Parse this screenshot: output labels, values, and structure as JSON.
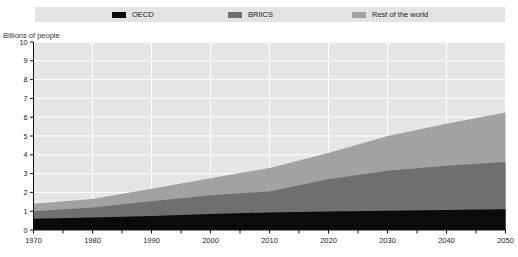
{
  "chart_data": {
    "type": "area",
    "stacked": true,
    "title": "",
    "ylabel": "Billions of people",
    "xlabel": "",
    "x": [
      1970,
      1980,
      1990,
      2000,
      2010,
      2020,
      2030,
      2040,
      2050
    ],
    "minor_tick_years": [
      1970,
      1975,
      1980,
      1985,
      1990,
      1995,
      2000,
      2005,
      2010,
      2015,
      2020,
      2025,
      2030,
      2035,
      2040,
      2045,
      2050
    ],
    "ylim": [
      0,
      10
    ],
    "yticks": [
      0,
      1,
      2,
      3,
      4,
      5,
      6,
      7,
      8,
      9,
      10
    ],
    "grid": true,
    "legend_position": "top",
    "series": [
      {
        "name": "OECD",
        "color": "#0b0b0b",
        "values": [
          0.6,
          0.66,
          0.74,
          0.85,
          0.93,
          0.99,
          1.03,
          1.07,
          1.1
        ]
      },
      {
        "name": "BRIICS",
        "color": "#6f6f6f",
        "values": [
          0.4,
          0.54,
          0.79,
          1.0,
          1.12,
          1.71,
          2.12,
          2.35,
          2.52
        ]
      },
      {
        "name": "Rest of the world",
        "color": "#a2a2a2",
        "values": [
          0.4,
          0.45,
          0.67,
          0.9,
          1.25,
          1.4,
          1.85,
          2.23,
          2.63
        ]
      }
    ],
    "stacked_totals": [
      1.4,
      1.65,
      2.2,
      2.75,
      3.3,
      4.1,
      5.0,
      5.65,
      6.25
    ]
  },
  "colors": {
    "plot_background": "#e6e6e6",
    "gridline": "#ffffff",
    "legend_background": "#e3e3e3",
    "axis": "#111111",
    "text": "#1a1a1a"
  }
}
